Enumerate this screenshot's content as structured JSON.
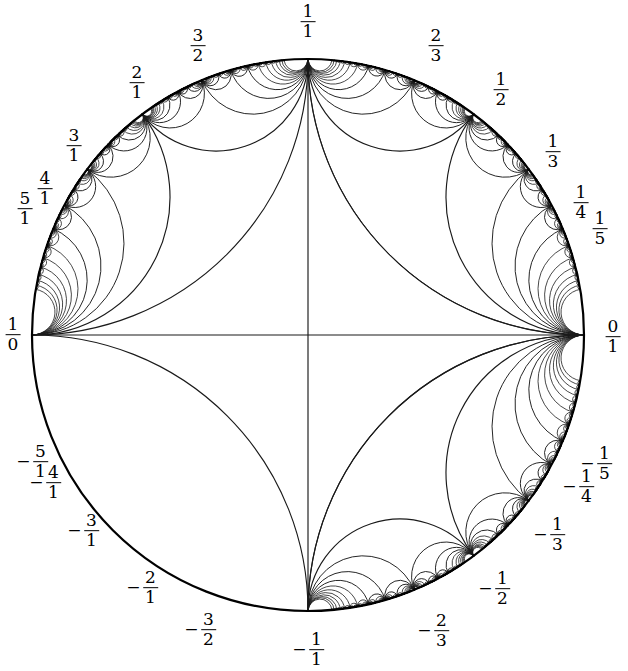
{
  "figure": {
    "type": "hyperbolic-tessellation",
    "background_color": "#ffffff",
    "stroke_color": "#1a1a1a",
    "disk": {
      "center_x": 308,
      "center_y": 335,
      "radius": 276,
      "boundary_stroke_color": "#000000",
      "boundary_stroke_width": 2.2
    }
  },
  "chart_data": {
    "type": "scatter",
    "xlabel": "",
    "ylabel": "",
    "grid": false,
    "legend": null,
    "labels": [
      {
        "text": "1/1",
        "numerator": "1",
        "denominator": "1",
        "negative": false,
        "angle_deg": 90,
        "value": 1
      },
      {
        "text": "3/2",
        "numerator": "3",
        "denominator": "2",
        "negative": false,
        "angle_deg": 115,
        "value": 1.5
      },
      {
        "text": "2/1",
        "numerator": "2",
        "denominator": "1",
        "negative": false,
        "angle_deg": 127,
        "value": 2
      },
      {
        "text": "3/1",
        "numerator": "3",
        "denominator": "1",
        "negative": false,
        "angle_deg": 143,
        "value": 3
      },
      {
        "text": "4/1",
        "numerator": "4",
        "denominator": "1",
        "negative": false,
        "angle_deg": 152,
        "value": 4
      },
      {
        "text": "5/1",
        "numerator": "5",
        "denominator": "1",
        "negative": false,
        "angle_deg": 158,
        "value": 5
      },
      {
        "text": "1/0",
        "numerator": "1",
        "denominator": "0",
        "negative": false,
        "angle_deg": 180,
        "value": null
      },
      {
        "text": "-5/1",
        "numerator": "5",
        "denominator": "1",
        "negative": true,
        "angle_deg": 202,
        "value": -5
      },
      {
        "text": "-4/1",
        "numerator": "4",
        "denominator": "1",
        "negative": true,
        "angle_deg": 208,
        "value": -4
      },
      {
        "text": "-3/1",
        "numerator": "3",
        "denominator": "1",
        "negative": true,
        "angle_deg": 217,
        "value": -3
      },
      {
        "text": "-2/1",
        "numerator": "2",
        "denominator": "1",
        "negative": true,
        "angle_deg": 233,
        "value": -2
      },
      {
        "text": "-3/2",
        "numerator": "3",
        "denominator": "2",
        "negative": true,
        "angle_deg": 245,
        "value": -1.5
      },
      {
        "text": "-1/1",
        "numerator": "1",
        "denominator": "1",
        "negative": true,
        "angle_deg": 270,
        "value": -1
      },
      {
        "text": "-2/3",
        "numerator": "2",
        "denominator": "3",
        "negative": true,
        "angle_deg": 295,
        "value": -0.6667
      },
      {
        "text": "-1/2",
        "numerator": "1",
        "denominator": "2",
        "negative": true,
        "angle_deg": 307,
        "value": -0.5
      },
      {
        "text": "-1/3",
        "numerator": "1",
        "denominator": "3",
        "negative": true,
        "angle_deg": 323,
        "value": -0.3333
      },
      {
        "text": "-1/4",
        "numerator": "1",
        "denominator": "4",
        "negative": true,
        "angle_deg": 332,
        "value": -0.25
      },
      {
        "text": "-1/5",
        "numerator": "1",
        "denominator": "5",
        "negative": true,
        "angle_deg": 338,
        "value": -0.2
      },
      {
        "text": "0/1",
        "numerator": "0",
        "denominator": "1",
        "negative": false,
        "angle_deg": 0,
        "value": 0
      },
      {
        "text": "1/5",
        "numerator": "1",
        "denominator": "5",
        "negative": false,
        "angle_deg": 22,
        "value": 0.2
      },
      {
        "text": "1/4",
        "numerator": "1",
        "denominator": "4",
        "negative": false,
        "angle_deg": 28,
        "value": 0.25
      },
      {
        "text": "1/3",
        "numerator": "1",
        "denominator": "3",
        "negative": false,
        "angle_deg": 37,
        "value": 0.3333
      },
      {
        "text": "1/2",
        "numerator": "1",
        "denominator": "2",
        "negative": false,
        "angle_deg": 53,
        "value": 0.5
      },
      {
        "text": "2/3",
        "numerator": "2",
        "denominator": "3",
        "negative": false,
        "angle_deg": 65,
        "value": 0.6667
      }
    ]
  },
  "label_positions": [
    {
      "id": "label-1-over-1",
      "x": 308,
      "y": 22,
      "align": "center",
      "negative": false,
      "num": "1",
      "den": "1"
    },
    {
      "id": "label-3-over-2",
      "x": 198,
      "y": 46,
      "align": "center",
      "negative": false,
      "num": "3",
      "den": "2"
    },
    {
      "id": "label-2-over-1",
      "x": 137,
      "y": 83,
      "align": "center",
      "negative": false,
      "num": "2",
      "den": "1"
    },
    {
      "id": "label-3-over-1",
      "x": 74,
      "y": 146,
      "align": "center",
      "negative": false,
      "num": "3",
      "den": "1"
    },
    {
      "id": "label-4-over-1",
      "x": 45,
      "y": 189,
      "align": "center",
      "negative": false,
      "num": "4",
      "den": "1"
    },
    {
      "id": "label-5-over-1",
      "x": 25,
      "y": 209,
      "align": "center",
      "negative": false,
      "num": "5",
      "den": "1"
    },
    {
      "id": "label-1-over-0",
      "x": 13,
      "y": 335,
      "align": "center",
      "negative": false,
      "num": "1",
      "den": "0"
    },
    {
      "id": "label-neg-5-over-1",
      "x": 32,
      "y": 462,
      "align": "center",
      "negative": true,
      "num": "5",
      "den": "1"
    },
    {
      "id": "label-neg-4-over-1",
      "x": 45,
      "y": 483,
      "align": "center",
      "negative": true,
      "num": "4",
      "den": "1"
    },
    {
      "id": "label-neg-3-over-1",
      "x": 83,
      "y": 531,
      "align": "center",
      "negative": true,
      "num": "3",
      "den": "1"
    },
    {
      "id": "label-neg-2-over-1",
      "x": 142,
      "y": 588,
      "align": "center",
      "negative": true,
      "num": "2",
      "den": "1"
    },
    {
      "id": "label-neg-3-over-2",
      "x": 200,
      "y": 630,
      "align": "center",
      "negative": true,
      "num": "3",
      "den": "2"
    },
    {
      "id": "label-neg-1-over-1",
      "x": 308,
      "y": 650,
      "align": "center",
      "negative": true,
      "num": "1",
      "den": "1"
    },
    {
      "id": "label-neg-2-over-3",
      "x": 433,
      "y": 631,
      "align": "center",
      "negative": true,
      "num": "2",
      "den": "3"
    },
    {
      "id": "label-neg-1-over-2",
      "x": 494,
      "y": 589,
      "align": "center",
      "negative": true,
      "num": "1",
      "den": "2"
    },
    {
      "id": "label-neg-1-over-3",
      "x": 549,
      "y": 535,
      "align": "center",
      "negative": true,
      "num": "1",
      "den": "3"
    },
    {
      "id": "label-neg-1-over-4",
      "x": 578,
      "y": 487,
      "align": "center",
      "negative": true,
      "num": "1",
      "den": "4"
    },
    {
      "id": "label-neg-1-over-5",
      "x": 596,
      "y": 464,
      "align": "center",
      "negative": true,
      "num": "1",
      "den": "5"
    },
    {
      "id": "label-0-over-1",
      "x": 613,
      "y": 337,
      "align": "center",
      "negative": false,
      "num": "0",
      "den": "1"
    },
    {
      "id": "label-1-over-5",
      "x": 600,
      "y": 229,
      "align": "center",
      "negative": false,
      "num": "1",
      "den": "5"
    },
    {
      "id": "label-1-over-4",
      "x": 581,
      "y": 203,
      "align": "center",
      "negative": false,
      "num": "1",
      "den": "4"
    },
    {
      "id": "label-1-over-3",
      "x": 553,
      "y": 152,
      "align": "center",
      "negative": false,
      "num": "1",
      "den": "3"
    },
    {
      "id": "label-1-over-2",
      "x": 501,
      "y": 90,
      "align": "center",
      "negative": false,
      "num": "1",
      "den": "2"
    },
    {
      "id": "label-2-over-3",
      "x": 436,
      "y": 46,
      "align": "center",
      "negative": false,
      "num": "2",
      "den": "3"
    }
  ]
}
